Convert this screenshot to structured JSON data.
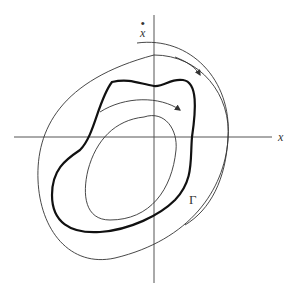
{
  "figure": {
    "axes": {
      "x_label": "x",
      "y_label": "x",
      "y_label_dot": "•"
    },
    "limit_cycle_label": "Γ",
    "colors": {
      "stroke": "#333333",
      "background": "#ffffff"
    },
    "curves": [
      {
        "name": "outer-trajectory",
        "style": "thin",
        "direction": "clockwise"
      },
      {
        "name": "limit-cycle",
        "style": "thick",
        "label": "Γ"
      },
      {
        "name": "inner-trajectory",
        "style": "thin",
        "direction": "clockwise"
      },
      {
        "name": "top-arc-trajectory",
        "style": "thin"
      }
    ]
  }
}
